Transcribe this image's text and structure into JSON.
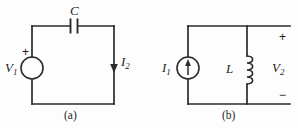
{
  "figure": {
    "background_color": "#fdfdfd",
    "line_color": "#2b2b2b",
    "text_color": "#1d1d1d"
  },
  "circuit_a": {
    "caption": "(a)",
    "source": {
      "symbol": "voltage-source",
      "label_main": "V",
      "label_sub": "1",
      "polarity_sign": "+"
    },
    "capacitor": {
      "symbol": "capacitor",
      "label_main": "C",
      "label_sub": ""
    },
    "current": {
      "symbol": "current-arrow-down",
      "label_main": "I",
      "label_sub": "2"
    }
  },
  "circuit_b": {
    "caption": "(b)",
    "source": {
      "symbol": "current-source",
      "label_main": "I",
      "label_sub": "1",
      "arrow_direction": "up"
    },
    "inductor": {
      "symbol": "inductor",
      "label_main": "L",
      "label_sub": ""
    },
    "output": {
      "label_main": "V",
      "label_sub": "2",
      "plus_sign": "+",
      "minus_sign": "−"
    }
  }
}
